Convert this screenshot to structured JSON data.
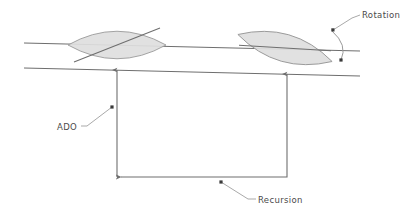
{
  "diagram": {
    "background_color": "#ffffff",
    "line_color": "#6e6e6e",
    "shape_fill": "#dedede",
    "shape_stroke": "#9a9a9a",
    "text_color": "#4a4a4a",
    "leader_color": "#8a8a8a",
    "dot_color": "#3a3a3a",
    "labels": {
      "rotation": "Rotation",
      "ado": "ADO",
      "recursion": "Recursion"
    },
    "guides": [
      {
        "name": "upper-guide-line",
        "x1": 24,
        "y1": 43,
        "x2": 360,
        "y2": 51
      },
      {
        "name": "lower-guide-line",
        "x1": 24,
        "y1": 68,
        "x2": 360,
        "y2": 76
      }
    ],
    "lenses": [
      {
        "name": "lens-left",
        "cx": 117,
        "cy": 45,
        "rx": 49,
        "ry": 24,
        "rotation_deg": 0,
        "chord_angle_deg": -22,
        "chord_len": 92
      },
      {
        "name": "lens-right",
        "cx": 285,
        "cy": 48,
        "rx": 49,
        "ry": 24,
        "rotation_deg": 16,
        "chord_angle_deg": -5,
        "chord_len": 96
      }
    ],
    "ado_arrows": [
      {
        "name": "ado-arrow-left",
        "x": 117,
        "y_top": 71,
        "y_bottom": 177
      },
      {
        "name": "ado-arrow-right",
        "x": 287,
        "y_top": 75,
        "y_bottom": 173
      }
    ],
    "recursion_path": {
      "name": "recursion-return-path",
      "from_x": 287,
      "from_y": 173,
      "corner_y": 177,
      "to_x": 117
    },
    "rotation_arc": {
      "name": "rotation-arc",
      "start_x": 332,
      "start_y": 30,
      "end_x": 341,
      "end_y": 60,
      "bow_x": 350,
      "bow_y": 45
    },
    "leaders": {
      "rotation": {
        "dot_x": 333,
        "dot_y": 30,
        "bend_x": 352,
        "bend_y": 18,
        "text_x": 362,
        "text_y": 15
      },
      "rotation_second_dot": {
        "x": 341,
        "y": 60
      },
      "ado": {
        "dot_x": 112,
        "dot_y": 107,
        "bend_x": 86,
        "bend_y": 127,
        "text_x": 57,
        "text_y": 130
      },
      "recursion": {
        "dot_x": 221,
        "dot_y": 182,
        "bend_x": 249,
        "bend_y": 200,
        "text_x": 258,
        "text_y": 203
      }
    }
  }
}
